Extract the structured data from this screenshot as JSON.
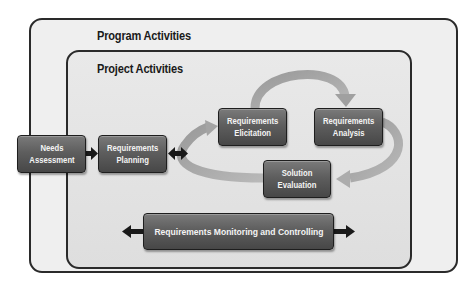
{
  "diagram": {
    "program": {
      "title": "Program Activities"
    },
    "project": {
      "title": "Project Activities"
    },
    "nodes": [
      {
        "id": "needs",
        "label": "Needs Assessment",
        "lines": [
          "Needs",
          "Assessment"
        ]
      },
      {
        "id": "planning",
        "label": "Requirements Planning",
        "lines": [
          "Requirements",
          "Planning"
        ]
      },
      {
        "id": "elicitation",
        "label": "Requirements Elicitation",
        "lines": [
          "Requirements",
          "Elicitation"
        ]
      },
      {
        "id": "analysis",
        "label": "Requirements Analysis",
        "lines": [
          "Requirements",
          "Analysis"
        ]
      },
      {
        "id": "evaluation",
        "label": "Solution Evaluation",
        "lines": [
          "Solution",
          "Evaluation"
        ]
      },
      {
        "id": "monitoring",
        "label": "Requirements Monitoring and Controlling",
        "lines": [
          "Requirements Monitoring and Controlling"
        ]
      }
    ],
    "edges": [
      {
        "from": "needs",
        "to": "planning",
        "type": "arrow"
      },
      {
        "from": "planning",
        "to": "cycle",
        "type": "double-arrow"
      },
      {
        "from": "elicitation",
        "to": "analysis",
        "type": "curved-arrow"
      },
      {
        "from": "analysis",
        "to": "evaluation",
        "type": "curved-arrow"
      },
      {
        "from": "evaluation",
        "to": "elicitation",
        "type": "curved-arrow"
      },
      {
        "from": "monitoring",
        "to": "left",
        "type": "double-arrow-horizontal"
      }
    ],
    "colors": {
      "box_fill": "#5e5e5e",
      "box_text": "#f4f4f4",
      "frame_border": "#2a2a2a",
      "program_bg": "#efefef",
      "project_bg": "#e4e4e4",
      "cycle_arrow": "#a8a8a8"
    }
  }
}
